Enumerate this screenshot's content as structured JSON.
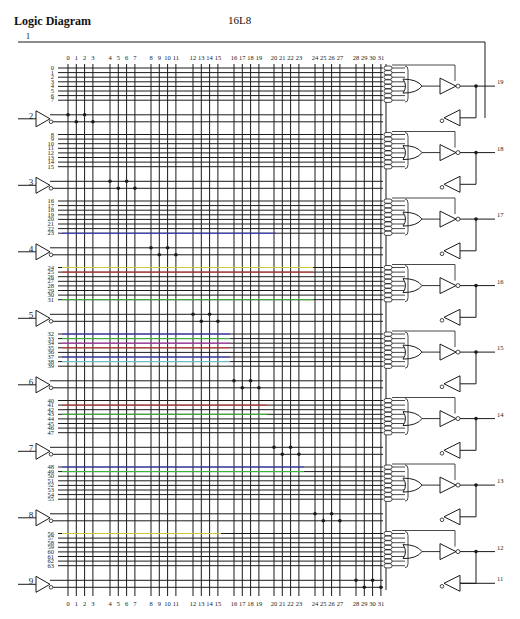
{
  "header": {
    "title": "Logic Diagram",
    "part_number": "16L8"
  },
  "top_pin": "1",
  "column_labels": [
    "0",
    "1",
    "2",
    "3",
    "4",
    "5",
    "6",
    "7",
    "8",
    "9",
    "10",
    "11",
    "12",
    "13",
    "14",
    "15",
    "16",
    "17",
    "18",
    "19",
    "20",
    "21",
    "22",
    "23",
    "24",
    "25",
    "26",
    "27",
    "28",
    "29",
    "30",
    "31"
  ],
  "input_pins": [
    "2",
    "3",
    "4",
    "5",
    "6",
    "7",
    "8",
    "9"
  ],
  "output_pins": [
    "19",
    "18",
    "17",
    "16",
    "15",
    "14",
    "13",
    "12"
  ],
  "last_input_pin": "11",
  "product_term_blocks": [
    {
      "output_pin": "19",
      "rows": [
        "0",
        "1",
        "2",
        "3",
        "4",
        "5",
        "6",
        "7"
      ]
    },
    {
      "output_pin": "18",
      "rows": [
        "8",
        "9",
        "10",
        "11",
        "12",
        "13",
        "14",
        "15"
      ]
    },
    {
      "output_pin": "17",
      "rows": [
        "16",
        "17",
        "18",
        "19",
        "20",
        "21",
        "22",
        "23"
      ]
    },
    {
      "output_pin": "16",
      "rows": [
        "24",
        "25",
        "26",
        "27",
        "28",
        "29",
        "30",
        "31"
      ]
    },
    {
      "output_pin": "15",
      "rows": [
        "32",
        "33",
        "34",
        "35",
        "36",
        "37",
        "38",
        "39"
      ]
    },
    {
      "output_pin": "14",
      "rows": [
        "40",
        "41",
        "42",
        "43",
        "44",
        "45",
        "46",
        "47"
      ]
    },
    {
      "output_pin": "13",
      "rows": [
        "48",
        "49",
        "50",
        "51",
        "52",
        "53",
        "54",
        "55"
      ]
    },
    {
      "output_pin": "12",
      "rows": [
        "56",
        "57",
        "58",
        "59",
        "60",
        "61",
        "62",
        "63"
      ]
    }
  ],
  "colors": {
    "line": "#1a1a1a",
    "red": "#d23a3a",
    "green": "#3fbf3f",
    "blue": "#3a3ad2",
    "magenta": "#c03ac0",
    "yellow": "#c8c83a",
    "cyan": "#6fd0e0"
  }
}
